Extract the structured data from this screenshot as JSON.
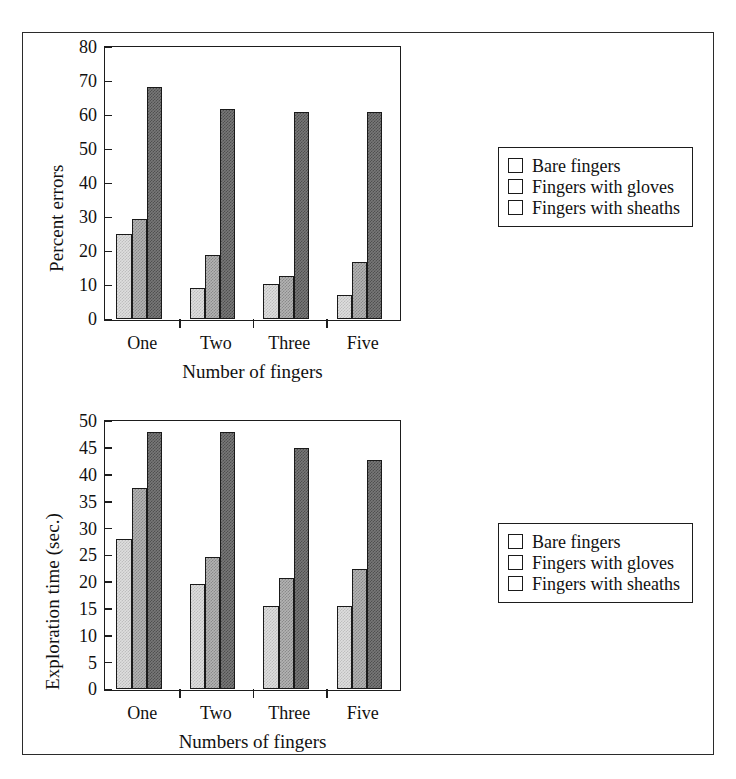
{
  "figure": {
    "frame": {
      "visible": true,
      "color": "#2b2b2b"
    }
  },
  "palette": {
    "series_light": "#dedede",
    "series_medium": "#b3b3b3",
    "series_dark": "#787878",
    "outline": "#1a1a1a",
    "axis": "#1d1d1d"
  },
  "legend": {
    "items": [
      {
        "label": "Bare fingers",
        "color": "#dedede"
      },
      {
        "label": "Fingers with gloves",
        "color": "#b3b3b3"
      },
      {
        "label": "Fingers with sheaths",
        "color": "#787878"
      }
    ]
  },
  "chart_data": [
    {
      "id": "percent-errors",
      "type": "bar",
      "title": "",
      "xlabel": "Number of fingers",
      "ylabel": "Percent errors",
      "categories": [
        "One",
        "Two",
        "Three",
        "Five"
      ],
      "ylim": [
        0,
        80
      ],
      "yticks": [
        0,
        10,
        20,
        30,
        40,
        50,
        60,
        70,
        80
      ],
      "ytick_labels": [
        "0",
        "10",
        "20",
        "30",
        "40",
        "50",
        "60",
        "70",
        "80"
      ],
      "grid": false,
      "legend_position": "right",
      "series": [
        {
          "name": "Bare fingers",
          "color": "#dedede",
          "values": [
            25.2,
            9.3,
            10.3,
            7.1
          ]
        },
        {
          "name": "Fingers with gloves",
          "color": "#b3b3b3",
          "values": [
            29.5,
            18.9,
            12.7,
            16.9
          ]
        },
        {
          "name": "Fingers with sheaths",
          "color": "#787878",
          "values": [
            68.5,
            61.8,
            60.9,
            61.0
          ]
        }
      ]
    },
    {
      "id": "exploration-time",
      "type": "bar",
      "title": "",
      "xlabel": "Numbers of fingers",
      "ylabel": "Exploration time (sec.)",
      "categories": [
        "One",
        "Two",
        "Three",
        "Five"
      ],
      "ylim": [
        0,
        50
      ],
      "yticks": [
        0,
        5,
        10,
        15,
        20,
        25,
        30,
        35,
        40,
        45,
        50
      ],
      "ytick_labels": [
        "0",
        "5",
        "10",
        "15",
        "20",
        "25",
        "30",
        "35",
        "40",
        "45",
        "50"
      ],
      "grid": false,
      "legend_position": "right",
      "series": [
        {
          "name": "Bare fingers",
          "color": "#dedede",
          "values": [
            28.0,
            19.7,
            15.5,
            15.5
          ]
        },
        {
          "name": "Fingers with gloves",
          "color": "#b3b3b3",
          "values": [
            37.5,
            24.7,
            20.8,
            22.5
          ]
        },
        {
          "name": "Fingers with sheaths",
          "color": "#787878",
          "values": [
            48.0,
            48.1,
            45.0,
            42.8
          ]
        }
      ]
    }
  ]
}
